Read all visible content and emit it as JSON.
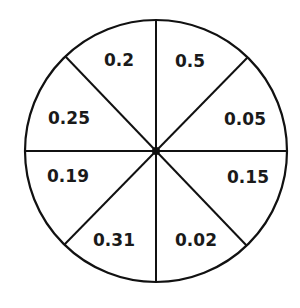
{
  "diagram": {
    "type": "spinner",
    "sector_count": 8,
    "colors": {
      "stroke": "#111111",
      "fill": "#ffffff",
      "text": "#1a1a1a"
    },
    "sectors": [
      {
        "position": "top-right-upper",
        "label": "0.5"
      },
      {
        "position": "top-right-lower",
        "label": "0.05"
      },
      {
        "position": "bottom-right-upper",
        "label": "0.15"
      },
      {
        "position": "bottom-right-lower",
        "label": "0.02"
      },
      {
        "position": "bottom-left-lower",
        "label": "0.31"
      },
      {
        "position": "bottom-left-upper",
        "label": "0.19"
      },
      {
        "position": "top-left-lower",
        "label": "0.25"
      },
      {
        "position": "top-left-upper",
        "label": "0.2"
      }
    ]
  }
}
